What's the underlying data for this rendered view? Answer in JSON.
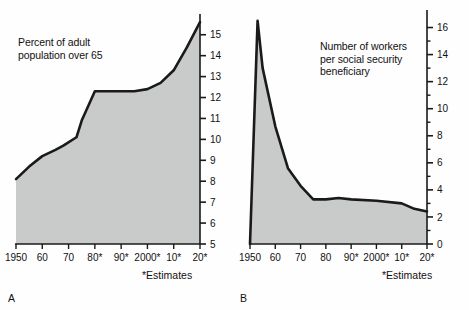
{
  "figure": {
    "panels": [
      {
        "letter": "A",
        "caption": "Percent of adult\npopulation over 65",
        "estimates_note": "*Estimates"
      },
      {
        "letter": "B",
        "caption": "Number of workers\nper social security\nbeneficiary",
        "estimates_note": "*Estimates"
      }
    ]
  },
  "colors": {
    "area_fill": "#c9cbca",
    "line": "#1a1a1a",
    "axis": "#1a1a1a",
    "background": "#fefefe",
    "text": "#111111"
  },
  "chart_data": [
    {
      "type": "area",
      "panel": "A",
      "title": "Percent of adult population over 65",
      "xlabel": "",
      "ylabel": "",
      "xlim": [
        1950,
        2020
      ],
      "ylim": [
        5,
        15.8
      ],
      "grid": false,
      "legend": "none",
      "y_axis_side": "right",
      "y_ticks": [
        5,
        6,
        7,
        8,
        9,
        10,
        11,
        12,
        13,
        14,
        15
      ],
      "y_tick_labels": [
        "5",
        "6",
        "7",
        "8",
        "9",
        "10",
        "11",
        "12",
        "13",
        "14",
        "15"
      ],
      "x_ticks": [
        1950,
        1960,
        1970,
        1980,
        1990,
        2000,
        2010,
        2020
      ],
      "x_tick_labels": [
        "1950",
        "60",
        "70",
        "80*",
        "90*",
        "2000*",
        "10*",
        "20*"
      ],
      "x": [
        1950,
        1955,
        1960,
        1965,
        1968,
        1973,
        1975,
        1980,
        1990,
        1995,
        2000,
        2005,
        2010,
        2015,
        2020
      ],
      "values": [
        8.1,
        8.7,
        9.2,
        9.5,
        9.7,
        10.1,
        10.9,
        12.3,
        12.3,
        12.3,
        12.4,
        12.7,
        13.3,
        14.4,
        15.6
      ]
    },
    {
      "type": "area",
      "panel": "B",
      "title": "Number of workers per social security beneficiary",
      "xlabel": "",
      "ylabel": "",
      "xlim": [
        1950,
        2020
      ],
      "ylim": [
        0,
        17
      ],
      "grid": false,
      "legend": "none",
      "y_axis_side": "right",
      "y_ticks": [
        0,
        1,
        2,
        3,
        4,
        5,
        6,
        7,
        8,
        9,
        10,
        11,
        12,
        13,
        14,
        15,
        16
      ],
      "y_major_ticks": [
        0,
        2,
        4,
        6,
        8,
        10,
        12,
        14,
        16
      ],
      "y_tick_labels": [
        "0",
        "2",
        "4",
        "6",
        "8",
        "10",
        "12",
        "14",
        "16"
      ],
      "x_ticks": [
        1950,
        1960,
        1970,
        1980,
        1990,
        2000,
        2010,
        2020
      ],
      "x_tick_labels": [
        "1950",
        "60",
        "70",
        "80",
        "90*",
        "2000*",
        "10*",
        "20*"
      ],
      "x": [
        1950,
        1953,
        1955,
        1960,
        1965,
        1970,
        1975,
        1980,
        1985,
        1990,
        2000,
        2010,
        2015,
        2020
      ],
      "values": [
        0.0,
        16.5,
        13.0,
        8.7,
        5.6,
        4.3,
        3.3,
        3.3,
        3.4,
        3.3,
        3.2,
        3.0,
        2.6,
        2.4
      ]
    }
  ]
}
